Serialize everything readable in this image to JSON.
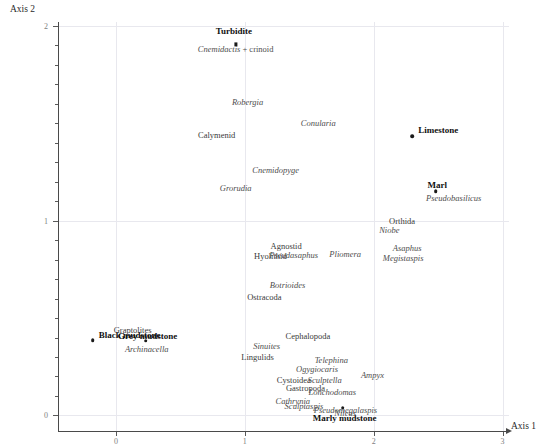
{
  "chart_data": {
    "type": "scatter",
    "title": "",
    "xlabel": "Axis 1",
    "ylabel": "Axis 2",
    "xlim": [
      -0.45,
      3.05
    ],
    "ylim": [
      -0.08,
      2.02
    ],
    "xticks": [
      0,
      1,
      2,
      3
    ],
    "yticks": [
      0,
      1,
      2
    ],
    "xtick_labels": [
      "0",
      "1",
      "2",
      "3"
    ],
    "ytick_labels": [
      "0",
      "1",
      "2"
    ],
    "grid": true,
    "legend": "none",
    "series": [
      {
        "name": "Sites",
        "style": "bold",
        "points": [
          {
            "label": "Turbidite",
            "x": 0.93,
            "y": 1.905,
            "label_dx": -2,
            "label_dy": -17,
            "marker": "square"
          },
          {
            "label": "Limestone",
            "x": 2.3,
            "y": 1.435,
            "label_dx": 6,
            "label_dy": -10,
            "marker": "circle"
          },
          {
            "label": "Marl",
            "x": 2.48,
            "y": 1.15,
            "label_dx": 2,
            "label_dy": -10,
            "marker": "circle"
          },
          {
            "label": "Black mudstone",
            "x": -0.18,
            "y": 0.385,
            "label_dx": 6,
            "label_dy": -9,
            "marker": "circle"
          },
          {
            "label": "Grey mudstone",
            "x": 0.23,
            "y": 0.383,
            "label_dx": 2,
            "label_dy": -9,
            "marker": "circle"
          },
          {
            "label": "Marly mudstone",
            "x": 1.76,
            "y": 0.04,
            "label_dx": 2,
            "label_dy": 6,
            "marker": "circle"
          }
        ]
      },
      {
        "name": "Taxa",
        "style": "italic",
        "points": [
          {
            "label": "Cnemidactis + crinoid",
            "x": 0.93,
            "y": 1.88,
            "kind": "mixed"
          },
          {
            "label": "Robergia",
            "x": 1.02,
            "y": 1.61,
            "kind": "italic"
          },
          {
            "label": "Conularia",
            "x": 1.57,
            "y": 1.5,
            "kind": "italic"
          },
          {
            "label": "Calymenid",
            "x": 0.78,
            "y": 1.44,
            "kind": "roman"
          },
          {
            "label": "Cnemidopyge",
            "x": 1.24,
            "y": 1.258,
            "kind": "italic"
          },
          {
            "label": "Grorudia",
            "x": 0.93,
            "y": 1.168,
            "kind": "italic"
          },
          {
            "label": "Pseudobasilicus",
            "x": 2.62,
            "y": 1.118,
            "kind": "italic"
          },
          {
            "label": "Orthida",
            "x": 2.22,
            "y": 1.0,
            "kind": "roman"
          },
          {
            "label": "Niobe",
            "x": 2.12,
            "y": 0.952,
            "kind": "italic"
          },
          {
            "label": "Agnostid",
            "x": 1.32,
            "y": 0.87,
            "kind": "roman"
          },
          {
            "label": "Asaphus",
            "x": 2.26,
            "y": 0.862,
            "kind": "italic"
          },
          {
            "label": "Pseudasaphus",
            "x": 1.38,
            "y": 0.825,
            "kind": "italic"
          },
          {
            "label": "Hyolithid",
            "x": 1.2,
            "y": 0.82,
            "kind": "roman"
          },
          {
            "label": "Pliomera",
            "x": 1.78,
            "y": 0.83,
            "kind": "italic"
          },
          {
            "label": "Megistaspis",
            "x": 2.23,
            "y": 0.808,
            "kind": "italic"
          },
          {
            "label": "Botrioides",
            "x": 1.33,
            "y": 0.672,
            "kind": "italic"
          },
          {
            "label": "Ostracoda",
            "x": 1.15,
            "y": 0.608,
            "kind": "roman"
          },
          {
            "label": "Graptolites",
            "x": 0.13,
            "y": 0.44,
            "kind": "roman"
          },
          {
            "label": "Cephalopoda",
            "x": 1.49,
            "y": 0.41,
            "kind": "roman"
          },
          {
            "label": "Sinuites",
            "x": 1.17,
            "y": 0.355,
            "kind": "italic"
          },
          {
            "label": "Archinacella",
            "x": 0.24,
            "y": 0.34,
            "kind": "italic"
          },
          {
            "label": "Lingulids",
            "x": 1.1,
            "y": 0.3,
            "kind": "roman"
          },
          {
            "label": "Telephina",
            "x": 1.67,
            "y": 0.285,
            "kind": "italic"
          },
          {
            "label": "Ogygiocaris",
            "x": 1.56,
            "y": 0.238,
            "kind": "italic"
          },
          {
            "label": "Ampyx",
            "x": 1.99,
            "y": 0.208,
            "kind": "italic"
          },
          {
            "label": "Cystoidea",
            "x": 1.38,
            "y": 0.18,
            "kind": "roman"
          },
          {
            "label": "Sculptella",
            "x": 1.62,
            "y": 0.18,
            "kind": "italic"
          },
          {
            "label": "Gastropoda",
            "x": 1.47,
            "y": 0.142,
            "kind": "roman"
          },
          {
            "label": "Lonchodomas",
            "x": 1.68,
            "y": 0.118,
            "kind": "italic"
          },
          {
            "label": "Cathrynia",
            "x": 1.37,
            "y": 0.072,
            "kind": "italic"
          },
          {
            "label": "Sculptaspis",
            "x": 1.46,
            "y": 0.048,
            "kind": "italic"
          },
          {
            "label": "Pseudomegalaspis",
            "x": 1.78,
            "y": 0.028,
            "kind": "italic"
          },
          {
            "label": "Nileus",
            "x": 1.78,
            "y": 0.01,
            "kind": "italic"
          }
        ]
      }
    ]
  },
  "axes": {
    "x_title": "Axis 1",
    "y_title": "Axis 2"
  }
}
